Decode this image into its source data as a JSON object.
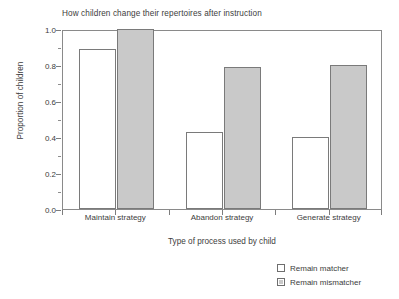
{
  "chart_data": {
    "type": "bar",
    "title": "How children change their repertoires after instruction",
    "xlabel": "Type of process used by child",
    "ylabel": "Proportion of children",
    "categories": [
      "Maintain strategy",
      "Abandon strategy",
      "Generate strategy"
    ],
    "series": [
      {
        "name": "Remain matcher",
        "color": "#ffffff",
        "values": [
          0.89,
          0.43,
          0.4
        ]
      },
      {
        "name": "Remain mismatcher",
        "color": "#c9c9c9",
        "values": [
          1.0,
          0.79,
          0.8
        ]
      }
    ],
    "ylim": [
      0.0,
      1.0
    ],
    "ytick_labels": [
      "1.0",
      "0.8",
      "0.6",
      "0.4",
      "0.2",
      "0.0"
    ],
    "ytick_values": [
      1.0,
      0.8,
      0.6,
      0.4,
      0.2,
      0.0
    ],
    "yminor_values": [
      0.9,
      0.7,
      0.5,
      0.3,
      0.1
    ],
    "grid": false,
    "legend_position": "bottom-right"
  },
  "axis": {
    "border_color": "#8a8a8a",
    "tick_color": "#7d7d7d"
  }
}
